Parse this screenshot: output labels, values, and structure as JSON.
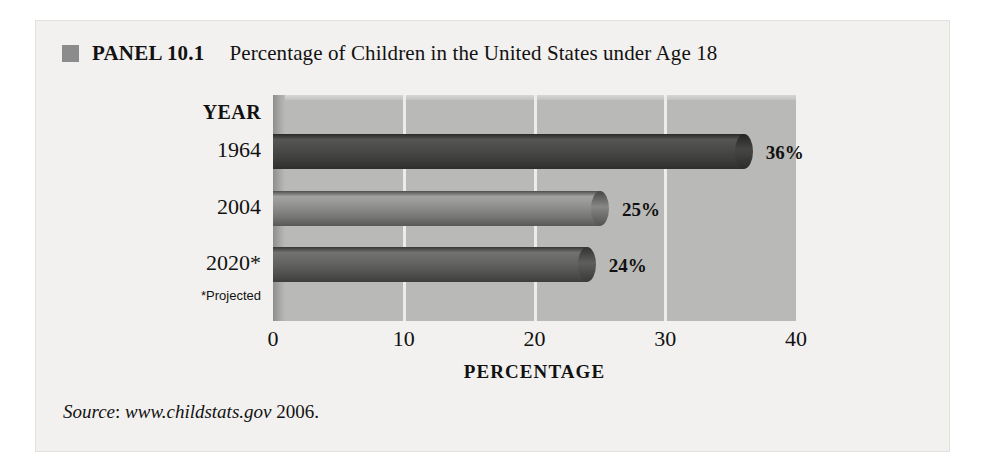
{
  "panel": {
    "bullet_icon": "square-bullet-icon",
    "label": "PANEL 10.1",
    "title": "Percentage of Children in the United States under Age 18",
    "accent_color": "#8c8c8c",
    "plot_bg_color": "#b9b9b7",
    "panel_bg_color": "#f2f1ef"
  },
  "axes": {
    "year_header": "YEAR",
    "x_title": "PERCENTAGE",
    "x_ticks": [
      "0",
      "10",
      "20",
      "30",
      "40"
    ],
    "projected_note": "*Projected"
  },
  "source": {
    "prefix": "Source",
    "colon": ": ",
    "url": "www.childstats.gov",
    "year": " 2006."
  },
  "chart_data": {
    "type": "bar",
    "orientation": "horizontal",
    "title": "Percentage of Children in the United States under Age 18",
    "xlabel": "PERCENTAGE",
    "ylabel": "YEAR",
    "xlim": [
      0,
      40
    ],
    "xticks": [
      0,
      10,
      20,
      30,
      40
    ],
    "grid": true,
    "grid_axis": "x",
    "legend": "none",
    "categories": [
      "1964",
      "2004",
      "2020*"
    ],
    "values": [
      36,
      25,
      24
    ],
    "data_labels": [
      "36%",
      "25%",
      "24%"
    ],
    "bar_colors": [
      "#4a4a48",
      "#8e8e8c",
      "#636361"
    ],
    "annotations": [
      "*Projected"
    ],
    "source": "Source: www.childstats.gov 2006."
  }
}
